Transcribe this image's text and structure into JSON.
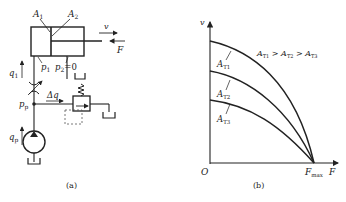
{
  "panel_a": {
    "caption": "(a)",
    "labels": {
      "A1": "A",
      "A1_sub": "1",
      "A2": "A",
      "A2_sub": "2",
      "v": "v",
      "F": "F",
      "p1": "p",
      "p1_sub": "1",
      "p2": "p",
      "p2_sub": "2",
      "p2_value": "=0",
      "q1": "q",
      "q1_sub": "1",
      "pp": "p",
      "pp_sub": "p",
      "dq": "Δq",
      "qp": "q",
      "qp_sub": "p"
    },
    "components": [
      "hydraulic-cylinder",
      "throttle-valve",
      "relief-valve",
      "pump",
      "tank"
    ]
  },
  "panel_b": {
    "caption": "(b)",
    "labels": {
      "y_axis": "v",
      "x_axis": "F",
      "origin": "O",
      "fmax": "F",
      "fmax_sub": "max",
      "relation": "A",
      "relation_parts": [
        "T1",
        "T2",
        "T3"
      ],
      "curve_label": "A"
    },
    "curves": [
      {
        "name": "A_T1",
        "sub": "T1",
        "v0": 1.0
      },
      {
        "name": "A_T2",
        "sub": "T2",
        "v0": 0.65
      },
      {
        "name": "A_T3",
        "sub": "T3",
        "v0": 0.45
      }
    ],
    "relation_text": "A_T1 > A_T2 > A_T3"
  }
}
